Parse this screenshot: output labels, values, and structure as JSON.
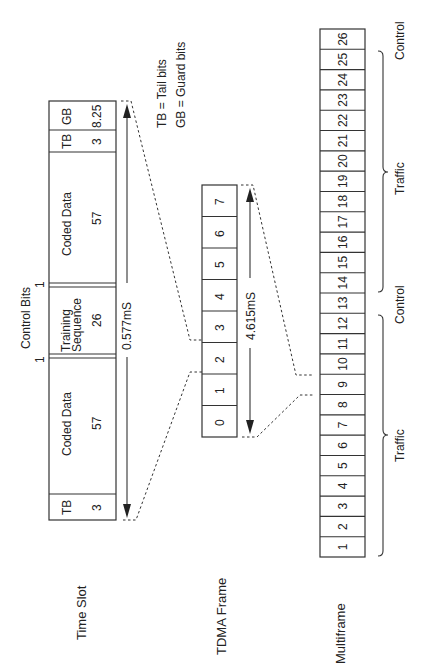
{
  "legend": {
    "tb": "TB = Tail bits",
    "gb": "GB = Guard bits"
  },
  "row_labels": {
    "time_slot": "Time Slot",
    "tdma_frame": "TDMA Frame",
    "multiframe": "Multiframe"
  },
  "time_slot": {
    "control_bits_label": "Control Bits",
    "control_bit_left": "1",
    "control_bit_right": "1",
    "duration": "0.577mS",
    "fields": [
      {
        "name": "TB",
        "bits": "3"
      },
      {
        "name": "Coded Data",
        "bits": "57"
      },
      {
        "name_line1": "Training",
        "name_line2": "Sequence",
        "bits": "26"
      },
      {
        "name": "Coded Data",
        "bits": "57"
      },
      {
        "name": "TB",
        "bits": "3"
      },
      {
        "name": "GB",
        "bits": "8.25"
      }
    ]
  },
  "tdma_frame": {
    "duration": "4.615mS",
    "slots": [
      "0",
      "1",
      "2",
      "3",
      "4",
      "5",
      "6",
      "7"
    ]
  },
  "multiframe": {
    "frames": [
      "1",
      "2",
      "3",
      "4",
      "5",
      "6",
      "7",
      "8",
      "9",
      "10",
      "11",
      "12",
      "13",
      "14",
      "15",
      "16",
      "17",
      "18",
      "19",
      "20",
      "21",
      "22",
      "23",
      "24",
      "25",
      "26"
    ],
    "groups": [
      {
        "label": "Traffic",
        "range": "1-12"
      },
      {
        "label": "Control",
        "range": "13"
      },
      {
        "label": "Traffic",
        "range": "14-25"
      },
      {
        "label": "Control",
        "range": "26"
      }
    ]
  }
}
